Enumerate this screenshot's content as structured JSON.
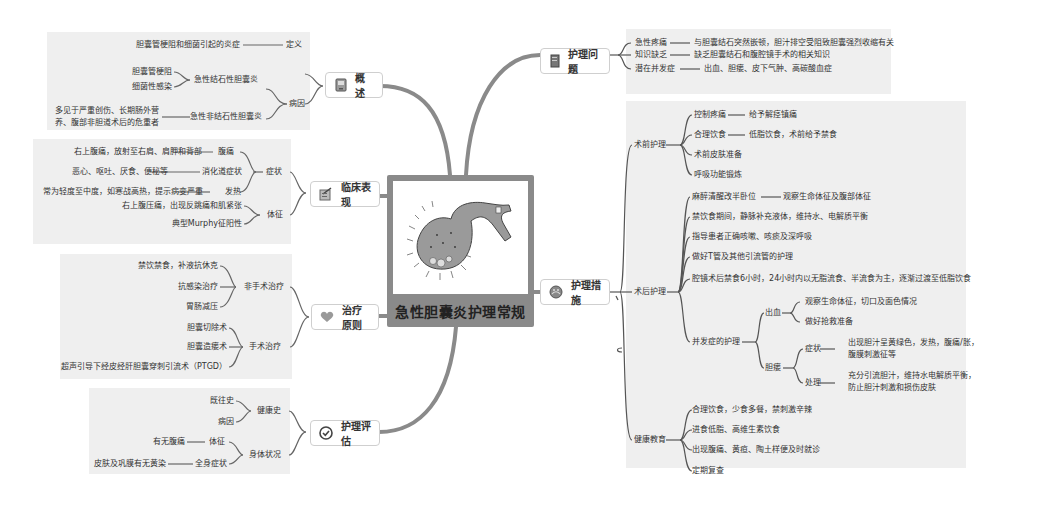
{
  "central": {
    "title": "急性胆囊炎护理常规",
    "image": "gallbladder-illustration"
  },
  "branches": {
    "overview": {
      "label": "概述",
      "icon": "document-icon",
      "definition_label": "定义",
      "definition_text": "胆囊管梗阻和细菌引起的炎症",
      "cause_label": "病因",
      "calculous_label": "急性结石性胆囊炎",
      "calculous_items": [
        "胆囊管梗阻",
        "细菌性感染"
      ],
      "acalculous_label": "急性非结石性胆囊炎",
      "acalculous_text": "多见于严重创伤、长期肠外营养、腹部非胆道术后的危重者"
    },
    "clinical": {
      "label": "临床表现",
      "icon": "clipboard-icon",
      "symptoms_label": "症状",
      "symptoms": [
        {
          "label": "腹痛",
          "desc": "右上腹痛，放射至右肩、肩胛和背部"
        },
        {
          "label": "消化道症状",
          "desc": "恶心、呕吐、厌食、便秘等"
        },
        {
          "label": "发热",
          "desc": "常为轻度至中度，如寒战高热，提示病变严重"
        }
      ],
      "signs_label": "体征",
      "signs": [
        "右上腹压痛，出现反跳痛和肌紧张",
        "典型Murphy征阳性"
      ]
    },
    "treatment": {
      "label": "治疗原则",
      "icon": "heart-icon",
      "nonsurgical_label": "非手术治疗",
      "nonsurgical": [
        "禁饮禁食，补液抗休克",
        "抗感染治疗",
        "胃肠减压"
      ],
      "surgical_label": "手术治疗",
      "surgical": [
        "胆囊切除术",
        "胆囊造瘘术",
        "超声引导下经皮经肝胆囊穿刺引流术（PTGD）"
      ]
    },
    "assessment": {
      "label": "护理评估",
      "icon": "check-circle-icon",
      "history_label": "健康史",
      "history": [
        "既往史",
        "病因"
      ],
      "physical_label": "身体状况",
      "physical": [
        {
          "label": "体征",
          "desc": "有无腹痛"
        },
        {
          "label": "全身症状",
          "desc": "皮肤及巩膜有无黄染"
        }
      ]
    },
    "problems": {
      "label": "护理问题",
      "icon": "notebook-icon",
      "items": [
        {
          "label": "急性疼痛",
          "desc": "与胆囊结石突然嵌顿，胆汁排空受阻致胆囊强烈收缩有关"
        },
        {
          "label": "知识缺乏",
          "desc": "缺乏胆囊结石和腹腔镜手术的相关知识"
        },
        {
          "label": "潜在并发症",
          "desc": "出血、胆瘘、皮下气肿、高碳酸血症"
        }
      ]
    },
    "measures": {
      "label": "护理措施",
      "icon": "globe-icon",
      "preop_label": "术前护理",
      "preop": [
        {
          "label": "控制疼痛",
          "desc": "给予解痉镇痛"
        },
        {
          "label": "合理饮食",
          "desc": "低脂饮食，术前给予禁食"
        },
        {
          "label": "术前皮肤准备",
          "desc": ""
        },
        {
          "label": "呼吸功能锻炼",
          "desc": ""
        }
      ],
      "postop_label": "术后护理",
      "postop": [
        {
          "label": "麻醉清醒改半卧位",
          "desc": "观察生命体征及腹部体征"
        },
        {
          "label": "禁饮食期间，静脉补充液体，维持水、电解质平衡",
          "desc": ""
        },
        {
          "label": "指导患者正确咳嗽、咳痰及深呼吸",
          "desc": ""
        },
        {
          "label": "做好T管及其他引流管的护理",
          "desc": ""
        },
        {
          "label": "腔镜术后禁食6小时，24小时内以无脂流食、半流食为主，逐渐过渡至低脂饮食",
          "desc": ""
        }
      ],
      "complication_label": "并发症的护理",
      "bleeding_label": "出血",
      "bleeding": [
        "观察生命体征，切口及面色情况",
        "做好抢救准备"
      ],
      "fistula_label": "胆瘘",
      "fistula_symptom_label": "症状",
      "fistula_symptom_text": "出现胆汁呈黄绿色，发热，腹痛/胀，腹膜刺激征等",
      "fistula_treat_label": "处理",
      "fistula_treat_text": "充分引流胆汁，维持水电解质平衡，防止胆汁刺激和损伤皮肤",
      "education_label": "健康教育",
      "education": [
        "合理饮食，少食多餐，禁刺激辛辣",
        "进食低脂、高维生素饮食",
        "出现腹痛、黄疸、陶土样便及时就诊",
        "定期复查"
      ]
    }
  },
  "colors": {
    "panel_bg": "#efefef",
    "connector_main": "#8a8a8a",
    "connector_thin": "#555555",
    "center_frame": "#8a8a8a"
  }
}
